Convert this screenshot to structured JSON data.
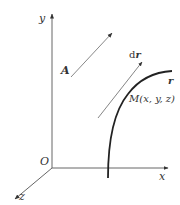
{
  "diagram": {
    "axes": {
      "x_label": "x",
      "y_label": "y",
      "z_label": "z",
      "origin_label": "O"
    },
    "vector_field": {
      "label": "A"
    },
    "curve": {
      "label": "r",
      "point_label": "M(x, y, z)",
      "tangent_label": "dr"
    },
    "colors": {
      "axis": "#555555",
      "curve": "#222222",
      "vector": "#777777",
      "text": "#333333"
    }
  }
}
